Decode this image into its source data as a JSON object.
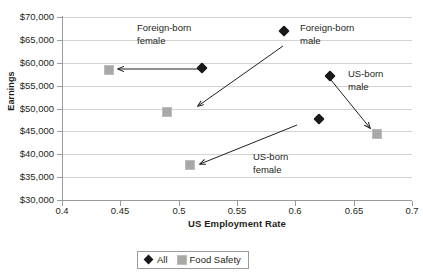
{
  "chart_data": {
    "type": "scatter",
    "title": "",
    "xlabel": "US Employment Rate",
    "ylabel": "Earnings",
    "xlim": [
      0.4,
      0.7
    ],
    "ylim": [
      30000,
      70000
    ],
    "xticks": [
      "0.4",
      "0.45",
      "0.5",
      "0.55",
      "0.6",
      "0.65",
      "0.7"
    ],
    "xtick_values": [
      0.4,
      0.45,
      0.5,
      0.55,
      0.6,
      0.65,
      0.7
    ],
    "yticks": [
      "$30,000",
      "$35,000",
      "$40,000",
      "$45,000",
      "$50,000",
      "$55,000",
      "$60,000",
      "$65,000",
      "$70,000"
    ],
    "ytick_values": [
      30000,
      35000,
      40000,
      45000,
      50000,
      55000,
      60000,
      65000,
      70000
    ],
    "grid": true,
    "legend_position": "bottom",
    "series": [
      {
        "name": "All",
        "marker": "diamond",
        "color": "#191919",
        "points": [
          {
            "label": "Foreign-born female",
            "x": 0.52,
            "y": 58800
          },
          {
            "label": "Foreign-born male",
            "x": 0.59,
            "y": 67000
          },
          {
            "label": "US-born male",
            "x": 0.63,
            "y": 57100
          },
          {
            "label": "US-born female",
            "x": 0.62,
            "y": 47800
          }
        ]
      },
      {
        "name": "Food Safety",
        "marker": "square",
        "color": "#a8a8a8",
        "points": [
          {
            "label": "Foreign-born female",
            "x": 0.44,
            "y": 58400
          },
          {
            "label": "Foreign-born male",
            "x": 0.49,
            "y": 49300
          },
          {
            "label": "US-born male",
            "x": 0.67,
            "y": 44400
          },
          {
            "label": "US-born female",
            "x": 0.51,
            "y": 37600
          }
        ]
      }
    ],
    "annotations": [
      {
        "text_line1": "Foreign-born",
        "text_line2": "female",
        "x": 137,
        "y": 22
      },
      {
        "text_line1": "Foreign-born",
        "text_line2": "male",
        "x": 300,
        "y": 22
      },
      {
        "text_line1": "US-born",
        "text_line2": "male",
        "x": 348,
        "y": 68
      },
      {
        "text_line1": "US-born",
        "text_line2": "female",
        "x": 253,
        "y": 151
      }
    ],
    "arrows": [
      {
        "name": "foreign-born-female-arrow",
        "x1": 200,
        "y1": 69,
        "x2": 118,
        "y2": 69
      },
      {
        "name": "foreign-born-male-arrow",
        "x1": 283,
        "y1": 46,
        "x2": 198,
        "y2": 106
      },
      {
        "name": "us-born-male-arrow",
        "x1": 331,
        "y1": 80,
        "x2": 370,
        "y2": 128
      },
      {
        "name": "us-born-female-arrow",
        "x1": 297,
        "y1": 125,
        "x2": 200,
        "y2": 164
      }
    ]
  },
  "legend": {
    "entries": [
      {
        "label": "All",
        "marker": "diamond"
      },
      {
        "label": "Food Safety",
        "marker": "square"
      }
    ]
  }
}
